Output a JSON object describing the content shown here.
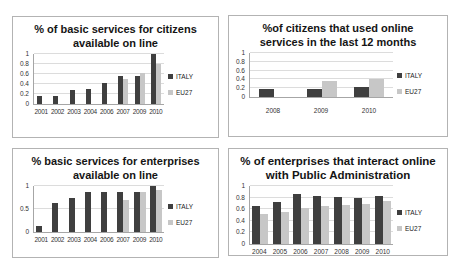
{
  "page": {
    "background": "#ffffff"
  },
  "colors": {
    "italy_bar": "#3f3f3f",
    "eu27_bar": "#c7c7c7",
    "panel_border": "#b3b3b3",
    "gridline": "#dcdcdc",
    "axis": "#a6a6a6"
  },
  "chart_data": [
    {
      "type": "bar",
      "title": "% of basic services for citizens available on line",
      "categories": [
        "2001",
        "2002",
        "2003",
        "2004",
        "2006",
        "2007",
        "2009",
        "2010"
      ],
      "series": [
        {
          "name": "ITALY",
          "color": "#3f3f3f",
          "values": [
            0.16,
            0.16,
            0.28,
            0.31,
            0.43,
            0.56,
            0.56,
            1.0
          ]
        },
        {
          "name": "EU27",
          "color": "#c7c7c7",
          "values": [
            null,
            null,
            null,
            null,
            null,
            0.5,
            0.63,
            0.8
          ]
        }
      ],
      "ylim": [
        0,
        1
      ],
      "yticks": [
        0,
        0.2,
        0.4,
        0.6,
        0.8,
        1
      ],
      "ytick_labels": [
        "0",
        "0.2",
        "0.4",
        "0.6",
        "0.8",
        "1"
      ],
      "grid": true,
      "legend_position": "right"
    },
    {
      "type": "bar",
      "title": "%of citizens that used online services in the last 12 months",
      "categories": [
        "2008",
        "2009",
        "2010"
      ],
      "series": [
        {
          "name": "ITALY",
          "color": "#3f3f3f",
          "values": [
            0.19,
            0.19,
            0.22
          ]
        },
        {
          "name": "EU27",
          "color": "#c7c7c7",
          "values": [
            null,
            0.37,
            0.41
          ]
        }
      ],
      "ylim": [
        0,
        1
      ],
      "yticks": [
        0,
        0.2,
        0.4,
        0.6,
        0.8,
        1
      ],
      "ytick_labels": [
        "0",
        "0.2",
        "0.4",
        "0.6",
        "0.8",
        "1"
      ],
      "grid": true,
      "legend_position": "right"
    },
    {
      "type": "bar",
      "title": "% basic services for enterprises available on line",
      "categories": [
        "2001",
        "2002",
        "2003",
        "2004",
        "2006",
        "2007",
        "2009",
        "2010"
      ],
      "series": [
        {
          "name": "ITALY",
          "color": "#3f3f3f",
          "values": [
            0.12,
            0.62,
            0.75,
            0.88,
            0.88,
            0.88,
            0.88,
            1.0
          ]
        },
        {
          "name": "EU27",
          "color": "#c7c7c7",
          "values": [
            null,
            null,
            null,
            null,
            null,
            0.7,
            0.87,
            0.92
          ]
        }
      ],
      "ylim": [
        0,
        1
      ],
      "yticks": [
        0,
        0.5,
        1
      ],
      "ytick_labels": [
        "0",
        "0.5",
        "1"
      ],
      "grid": true,
      "legend_position": "right"
    },
    {
      "type": "bar",
      "title": "% of enterprises that interact online with Public Administration",
      "categories": [
        "2004",
        "2005",
        "2006",
        "2007",
        "2008",
        "2009",
        "2010"
      ],
      "series": [
        {
          "name": "ITALY",
          "color": "#3f3f3f",
          "values": [
            0.65,
            0.72,
            0.86,
            0.83,
            0.81,
            0.8,
            0.83
          ]
        },
        {
          "name": "EU27",
          "color": "#c7c7c7",
          "values": [
            0.51,
            0.56,
            0.62,
            0.65,
            0.68,
            0.69,
            0.75
          ]
        }
      ],
      "ylim": [
        0,
        1
      ],
      "yticks": [
        0,
        0.2,
        0.4,
        0.6,
        0.8,
        1
      ],
      "ytick_labels": [
        "0",
        "0.2",
        "0.4",
        "0.6",
        "0.8",
        "1"
      ],
      "grid": true,
      "legend_position": "right"
    }
  ]
}
